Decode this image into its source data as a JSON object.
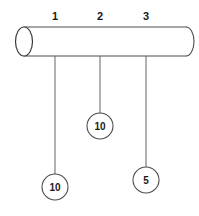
{
  "figure": {
    "name": "hanging-weights-on-cylinder",
    "background_color": "#ffffff",
    "stroke_color": "#4d4d4d",
    "text_color": "#1a1a1a",
    "width": 199,
    "height": 216
  },
  "cylinder": {
    "name": "horizontal-cylinder-rod",
    "left_x": 16,
    "right_x": 186,
    "top_y": 27,
    "bottom_y": 56,
    "end_cap_rx": 8,
    "end_cap_ry": 14.5,
    "left_end_style": "open-ellipse",
    "right_end_style": "rounded-cap"
  },
  "positions": {
    "name": "position-tick-labels",
    "items": [
      {
        "label": "1",
        "x": 55,
        "label_y": 20
      },
      {
        "label": "2",
        "x": 100,
        "label_y": 20
      },
      {
        "label": "3",
        "x": 146,
        "label_y": 20
      }
    ]
  },
  "hangers": [
    {
      "name": "hanger-1",
      "position_label": "1",
      "line_x": 55,
      "line_top_y": 56,
      "line_bottom_y": 174,
      "circle_cx": 55,
      "circle_cy": 187,
      "circle_r": 13,
      "weight": "10"
    },
    {
      "name": "hanger-2",
      "position_label": "2",
      "line_x": 100,
      "line_top_y": 56,
      "line_bottom_y": 113,
      "circle_cx": 100,
      "circle_cy": 126,
      "circle_r": 13,
      "weight": "10"
    },
    {
      "name": "hanger-3",
      "position_label": "3",
      "line_x": 146,
      "line_top_y": 56,
      "line_bottom_y": 167,
      "circle_cx": 146,
      "circle_cy": 180,
      "circle_r": 13,
      "weight": "5"
    }
  ]
}
